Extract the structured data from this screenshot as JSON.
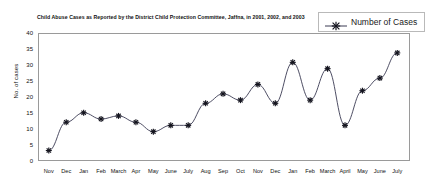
{
  "chart_data": {
    "type": "line",
    "title": "Child Abuse Cases as Reported by the District Child Protection Committee, Jaffna, in 2001, 2002, and 2003",
    "title_line1": "Child Abuse Cases as Reported by the District Child Protection Committee, Jaffna, in 2001, 2002,",
    "title_line2": "and 2003",
    "xlabel": "",
    "ylabel": "No. of cases",
    "ylim": [
      0,
      40
    ],
    "ytick_values": [
      0,
      5,
      10,
      15,
      20,
      25,
      30,
      35,
      40
    ],
    "ytick_labels": [
      "0",
      "5",
      "10",
      "15",
      "20",
      "25",
      "30",
      "35",
      "40"
    ],
    "grid": false,
    "legend_position": "top-right",
    "legend": [
      "Number of Cases"
    ],
    "marker": "star",
    "line_color": "#3a3a52",
    "marker_color": "#14141e",
    "categories": [
      "Nov",
      "Dec",
      "Jan",
      "Feb",
      "March",
      "Apr",
      "May",
      "June",
      "July",
      "Aug",
      "Sep",
      "Oct",
      "Nov",
      "Dec",
      "Jan",
      "Feb",
      "March",
      "April",
      "May",
      "June",
      "July"
    ],
    "series": [
      {
        "name": "Number of Cases",
        "values": [
          3,
          12,
          15,
          13,
          14,
          12,
          9,
          11,
          11,
          18,
          21,
          19,
          24,
          18,
          31,
          19,
          29,
          11,
          22,
          26,
          34
        ]
      }
    ]
  },
  "legend": {
    "marker_icon": "star-marker-icon",
    "label": "Number of Cases"
  }
}
